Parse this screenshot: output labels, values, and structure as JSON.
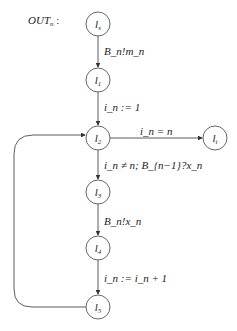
{
  "diagram": {
    "title": "OUT",
    "title_sub": "n",
    "title_suffix": " :",
    "nodes": [
      {
        "id": "ls",
        "label": "l",
        "sub": "s"
      },
      {
        "id": "l1",
        "label": "l",
        "sub": "1"
      },
      {
        "id": "l2",
        "label": "l",
        "sub": "2"
      },
      {
        "id": "lt",
        "label": "l",
        "sub": "t"
      },
      {
        "id": "l3",
        "label": "l",
        "sub": "3"
      },
      {
        "id": "l4",
        "label": "l",
        "sub": "4"
      },
      {
        "id": "l5",
        "label": "l",
        "sub": "5"
      }
    ],
    "edges": [
      {
        "from": "ls",
        "to": "l1",
        "label": "B_n!m_n"
      },
      {
        "from": "l1",
        "to": "l2",
        "label": "i_n := 1"
      },
      {
        "from": "l2",
        "to": "lt",
        "label": "i_n = n"
      },
      {
        "from": "l2",
        "to": "l3",
        "label": "i_n ≠ n; B_{n−1}?x_n"
      },
      {
        "from": "l3",
        "to": "l4",
        "label": "B_n!x_n"
      },
      {
        "from": "l4",
        "to": "l5",
        "label": "i_n := i_n + 1"
      },
      {
        "from": "l5",
        "to": "l2",
        "label": ""
      }
    ]
  }
}
